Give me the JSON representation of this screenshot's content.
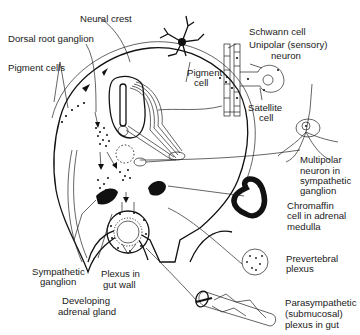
{
  "figure": {
    "labels": {
      "neural_crest": "Neural crest",
      "dorsal_root_ganglion": "Dorsal root ganglion",
      "pigment_cells": "Pigment cells",
      "pigment_cell_1": "Pigment",
      "pigment_cell_2": "cell",
      "schwann_cell": "Schwann cell",
      "unipolar_1": "Unipolar (sensory)",
      "unipolar_2": "neuron",
      "satellite_1": "Satellite",
      "satellite_2": "cell",
      "multipolar_1": "Multipolar",
      "multipolar_2": "neuron in",
      "multipolar_3": "sympathetic",
      "multipolar_4": "ganglion",
      "chromaffin_1": "Chromaffin",
      "chromaffin_2": "cell in adrenal",
      "chromaffin_3": "medulla",
      "prevertebral_1": "Prevertebral",
      "prevertebral_2": "plexus",
      "parasym_1": "Parasympathetic",
      "parasym_2": "(submucosal)",
      "parasym_3": "plexus in gut",
      "sympathetic_1": "Sympathetic",
      "sympathetic_2": "ganglion",
      "plexus_gut_1": "Plexus in",
      "plexus_gut_2": "gut wall",
      "adrenal_1": "Developing",
      "adrenal_2": "adrenal gland"
    }
  }
}
